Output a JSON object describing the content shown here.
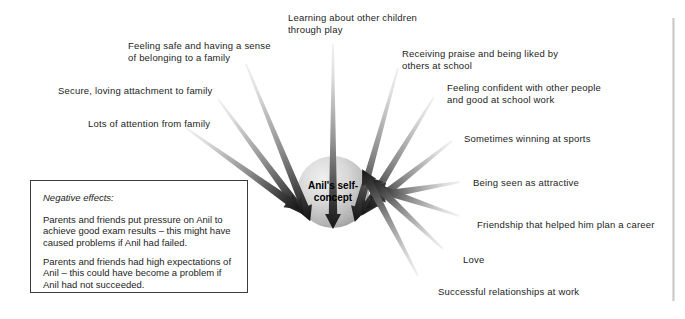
{
  "diagram": {
    "hub": {
      "line1": "Anil's self-",
      "line2": "concept",
      "center_x": 333,
      "center_y": 192,
      "radius": 36,
      "fill_light": "#e2e2e2",
      "fill_dark": "#9b9b9b"
    },
    "arrow_colors": {
      "tail": "#f2f2f2",
      "mid": "#8c8c8c",
      "head": "#141414"
    },
    "positive_influences": [
      {
        "id": "feeling-safe-belonging",
        "text": "Feeling safe and having a sense\nof belonging to a family",
        "label_x": 128,
        "label_y": 40,
        "tail_x": 246,
        "tail_y": 64,
        "angle_deg": 232
      },
      {
        "id": "secure-loving-attachment",
        "text": "Secure, loving attachment to family",
        "label_x": 58,
        "label_y": 85,
        "tail_x": 218,
        "tail_y": 99,
        "angle_deg": 218
      },
      {
        "id": "lots-of-attention",
        "text": "Lots of attention from family",
        "label_x": 88,
        "label_y": 118,
        "tail_x": 186,
        "tail_y": 128,
        "angle_deg": 208
      },
      {
        "id": "learning-through-play",
        "text": "Learning about other children\nthrough play",
        "label_x": 288,
        "label_y": 12,
        "tail_x": 333,
        "tail_y": 44,
        "angle_deg": 270
      },
      {
        "id": "receiving-praise",
        "text": "Receiving praise and being liked by\nothers at school",
        "label_x": 402,
        "label_y": 48,
        "tail_x": 398,
        "tail_y": 68,
        "angle_deg": 306
      },
      {
        "id": "feeling-confident",
        "text": "Feeling confident with other people\nand good at school work",
        "label_x": 447,
        "label_y": 82,
        "tail_x": 434,
        "tail_y": 97,
        "angle_deg": 320
      },
      {
        "id": "sometimes-winning-sports",
        "text": "Sometimes winning at sports",
        "label_x": 464,
        "label_y": 133,
        "tail_x": 452,
        "tail_y": 141,
        "angle_deg": 333
      },
      {
        "id": "being-seen-attractive",
        "text": "Being seen as attractive",
        "label_x": 473,
        "label_y": 177,
        "tail_x": 460,
        "tail_y": 182,
        "angle_deg": 352
      },
      {
        "id": "friendship-career",
        "text": "Friendship that helped him plan a career",
        "label_x": 477,
        "label_y": 219,
        "tail_x": 459,
        "tail_y": 216,
        "angle_deg": 10
      },
      {
        "id": "love",
        "text": "Love",
        "label_x": 463,
        "label_y": 254,
        "tail_x": 443,
        "tail_y": 249,
        "angle_deg": 24
      },
      {
        "id": "successful-relationships",
        "text": "Successful relationships at work",
        "label_x": 438,
        "label_y": 286,
        "tail_x": 418,
        "tail_y": 276,
        "angle_deg": 38
      }
    ],
    "negative_effects_box": {
      "title": "Negative effects:",
      "paragraph_1": "Parents and friends put pressure on Anil to\nachieve good exam results – this might have\ncaused problems if Anil had failed.",
      "paragraph_2": "Parents and friends had high expectations of\nAnil – this could have become a problem if\nAnil had not succeeded."
    }
  }
}
